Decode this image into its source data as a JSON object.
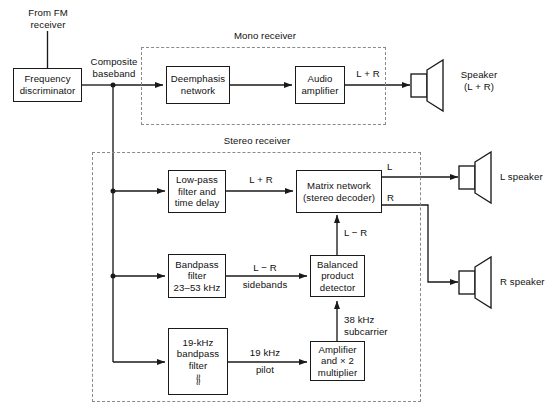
{
  "diagram": {
    "groups": [
      {
        "id": "mono",
        "label": "Mono receiver"
      },
      {
        "id": "stereo",
        "label": "Stereo receiver"
      }
    ],
    "blocks": [
      {
        "id": "freq_disc",
        "lines": [
          "Frequency",
          "discriminator"
        ]
      },
      {
        "id": "deemphasis",
        "lines": [
          "Deemphasis",
          "network"
        ]
      },
      {
        "id": "audio_amp",
        "lines": [
          "Audio",
          "amplifier"
        ]
      },
      {
        "id": "lowpass",
        "lines": [
          "Low-pass",
          "filter and",
          "time delay"
        ]
      },
      {
        "id": "matrix",
        "lines": [
          "Matrix network",
          "(stereo decoder)"
        ]
      },
      {
        "id": "bandpass",
        "lines": [
          "Bandpass",
          "filter",
          "23–53 kHz"
        ]
      },
      {
        "id": "balanced",
        "lines": [
          "Balanced",
          "product",
          "detector"
        ]
      },
      {
        "id": "bpf19",
        "lines": [
          "19-kHz",
          "bandpass",
          "filter"
        ],
        "symbol": "≈≈"
      },
      {
        "id": "amp_x2",
        "lines": [
          "Amplifier",
          "and × 2",
          "multiplier"
        ]
      }
    ],
    "labels": [
      {
        "id": "from_fm",
        "lines": [
          "From FM",
          "receiver"
        ]
      },
      {
        "id": "composite",
        "lines": [
          "Composite",
          "baseband"
        ]
      },
      {
        "id": "mono_lr",
        "lines": [
          "L + R"
        ]
      },
      {
        "id": "speaker_mono",
        "lines": [
          "Speaker",
          "(L + R)"
        ]
      },
      {
        "id": "stereo_lr_sum",
        "lines": [
          "L + R"
        ]
      },
      {
        "id": "matrix_l",
        "lines": [
          "L"
        ]
      },
      {
        "id": "matrix_r",
        "lines": [
          "R"
        ]
      },
      {
        "id": "l_speaker",
        "lines": [
          "L speaker"
        ]
      },
      {
        "id": "r_speaker",
        "lines": [
          "R speaker"
        ]
      },
      {
        "id": "lr_diff_in",
        "lines": [
          "L − R"
        ]
      },
      {
        "id": "lr_diff_side",
        "lines": [
          "L − R",
          "sidebands"
        ]
      },
      {
        "id": "subcarrier",
        "lines": [
          "38 kHz",
          "subcarrier"
        ]
      },
      {
        "id": "pilot",
        "lines": [
          "19 kHz",
          "pilot"
        ]
      }
    ],
    "icons": [
      {
        "id": "speaker_mono_icon",
        "name": "speaker-icon"
      },
      {
        "id": "speaker_l_icon",
        "name": "speaker-icon"
      },
      {
        "id": "speaker_r_icon",
        "name": "speaker-icon"
      }
    ],
    "colors": {
      "stroke": "#1a1a1a",
      "dashed": "#8a8a8a",
      "background": "#ffffff",
      "text": "#111111"
    }
  }
}
